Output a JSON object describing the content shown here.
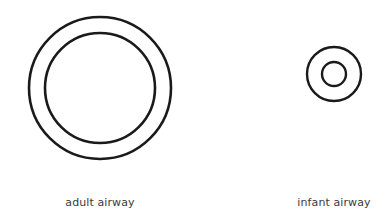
{
  "diagram": {
    "background": "#ffffff",
    "stroke_color": "#1a1a1a",
    "figures": [
      {
        "id": "adult",
        "label": "adult airway",
        "outer_ring": {
          "cx": 100,
          "cy": 88,
          "r": 71
        },
        "inner_lumen": {
          "cx": 100,
          "cy": 88,
          "r": 55
        }
      },
      {
        "id": "infant",
        "label": "infant airway",
        "outer_ring": {
          "cx": 334,
          "cy": 74,
          "r": 27
        },
        "inner_lumen": {
          "cx": 334,
          "cy": 74,
          "r": 12
        }
      }
    ]
  }
}
